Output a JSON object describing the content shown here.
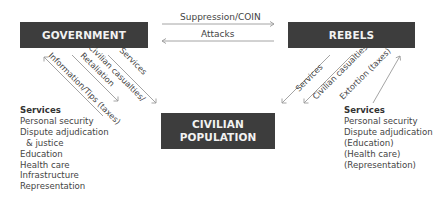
{
  "nodes": {
    "government": "GOVERNMENT",
    "rebels": "REBELS",
    "civilian_line1": "CIVILIAN",
    "civilian_line2": "POPULATION"
  },
  "edges": {
    "gov_to_rebels": "Suppression/COIN",
    "rebels_to_gov": "Attacks",
    "civ_to_gov": "Information/Tips (taxes)",
    "gov_to_civ_retaliation_1": "Civilian casualties/",
    "gov_to_civ_retaliation_2": "Retaliation",
    "gov_to_civ_services": "Services",
    "rebels_to_civ_services": "Services",
    "rebels_to_civ_casualties": "Civilian casualties",
    "civ_to_rebels": "Extortion (taxes)"
  },
  "government_services": {
    "title": "Services",
    "items": [
      "Personal security",
      "Dispute adjudication",
      "& justice",
      "Education",
      "Health care",
      "Infrastructure",
      "Representation"
    ]
  },
  "rebel_services": {
    "title": "Services",
    "items": [
      "Personal security",
      "Dispute adjudication",
      "(Education)",
      "(Health care)",
      "(Representation)"
    ]
  },
  "colors": {
    "box_fill": "#3d3d3d",
    "box_text": "#f2f2f2",
    "arrow": "#9a9a9a",
    "text": "#444444"
  }
}
